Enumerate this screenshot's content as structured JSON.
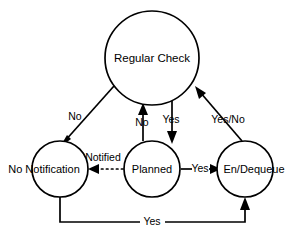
{
  "diagram": {
    "type": "state-transition-diagram",
    "background_color": "#ffffff",
    "stroke_color": "#000000",
    "states": [
      {
        "id": "regular_check",
        "label": "Regular Check",
        "cx": 152,
        "cy": 58,
        "r": 47
      },
      {
        "id": "no_notification",
        "label": "No Notification",
        "cx": 60,
        "cy": 169,
        "r": 28
      },
      {
        "id": "planned",
        "label": "Planned",
        "cx": 152,
        "cy": 169,
        "r": 28
      },
      {
        "id": "en_dequeue",
        "label": "En/Dequeue",
        "cx": 245,
        "cy": 169,
        "r": 28
      }
    ],
    "transitions": [
      {
        "id": "check_to_nonotify",
        "from": "regular_check",
        "to": "no_notification",
        "label": "No",
        "style": "solid",
        "label_x": 75,
        "label_y": 117
      },
      {
        "id": "planned_to_check",
        "from": "planned",
        "to": "regular_check",
        "label": "No",
        "style": "solid",
        "label_x": 142,
        "label_y": 122
      },
      {
        "id": "check_to_planned",
        "from": "regular_check",
        "to": "planned",
        "label": "Yes",
        "style": "solid",
        "label_x": 171,
        "label_y": 120
      },
      {
        "id": "dequeue_to_check",
        "from": "en_dequeue",
        "to": "regular_check",
        "label": "Yes/No",
        "style": "solid",
        "label_x": 228,
        "label_y": 120
      },
      {
        "id": "planned_to_nonotify",
        "from": "planned",
        "to": "no_notification",
        "label": "Notified",
        "style": "dotted",
        "label_x": 103,
        "label_y": 159
      },
      {
        "id": "planned_to_dequeue",
        "from": "planned",
        "to": "en_dequeue",
        "label": "Yes",
        "style": "solid",
        "label_x": 200,
        "label_y": 169
      },
      {
        "id": "nonotify_to_dequeue",
        "from": "no_notification",
        "to": "en_dequeue",
        "label": "Yes",
        "style": "solid",
        "label_x": 152,
        "label_y": 222
      }
    ]
  }
}
